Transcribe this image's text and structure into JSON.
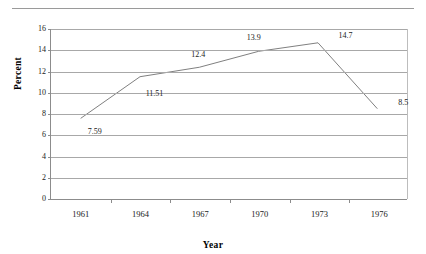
{
  "chart_data": {
    "type": "line",
    "title": "",
    "xlabel": "Year",
    "ylabel": "Percent",
    "categories": [
      "1961",
      "1964",
      "1967",
      "1970",
      "1973",
      "1976"
    ],
    "values": [
      7.59,
      11.51,
      12.4,
      13.9,
      14.7,
      8.5
    ],
    "point_labels": [
      "7.59",
      "11.51",
      "12.4",
      "13.9",
      "14.7",
      "8.5"
    ],
    "ylim": [
      0,
      16
    ],
    "yticks": [
      "16",
      "14",
      "12",
      "10",
      "8",
      "6",
      "4",
      "2",
      "0"
    ],
    "ytick_values": [
      16,
      14,
      12,
      10,
      8,
      6,
      4,
      2,
      0
    ],
    "grid": "horizontal",
    "legend": "none",
    "series_color": "#808080",
    "grid_color": "#a8a8a8",
    "axis_color": "#8c8c8c",
    "rule_color": "#9a9a9a"
  }
}
